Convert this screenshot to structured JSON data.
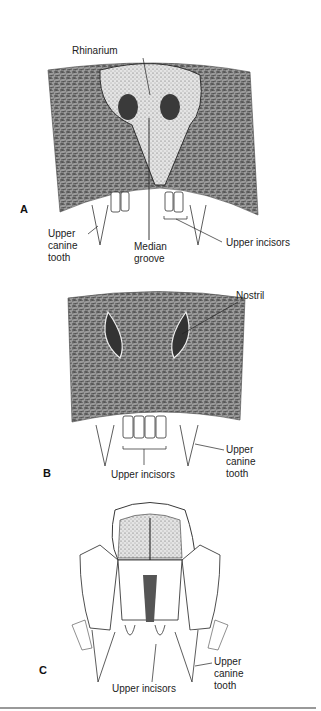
{
  "figure": {
    "panels": [
      {
        "id": "A",
        "labels": {
          "rhinarium": "Rhinarium",
          "upper_canine": "Upper\ncanine\ntooth",
          "median_groove": "Median\ngroove",
          "upper_incisors": "Upper incisors"
        }
      },
      {
        "id": "B",
        "labels": {
          "nostril": "Nostril",
          "upper_incisors": "Upper incisors",
          "upper_canine": "Upper\ncanine\ntooth"
        }
      },
      {
        "id": "C",
        "labels": {
          "upper_incisors": "Upper incisors",
          "upper_canine": "Upper\ncanine\ntooth"
        }
      }
    ]
  },
  "colors": {
    "ink": "#1a1a1a",
    "fur": "#7a7a7a",
    "background": "#ffffff"
  }
}
